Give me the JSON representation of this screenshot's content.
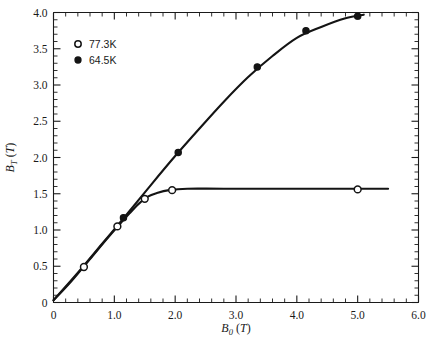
{
  "chart_data": {
    "type": "scatter",
    "title": "",
    "xlabel": "B_0 (T)",
    "xlabel_base": "B",
    "xlabel_sub": "0",
    "xlabel_unit": "(T)",
    "ylabel": "B_T (T)",
    "ylabel_base": "B",
    "ylabel_sub": "T",
    "ylabel_unit": "(T)",
    "xlim": [
      0,
      6.0
    ],
    "ylim": [
      0,
      4.0
    ],
    "xticks": [
      0,
      1.0,
      2.0,
      3.0,
      4.0,
      5.0,
      6.0
    ],
    "xticklabels": [
      "0",
      "1.0",
      "2.0",
      "3.0",
      "4.0",
      "5.0",
      "6.0"
    ],
    "yticks": [
      0,
      0.5,
      1.0,
      1.5,
      2.0,
      2.5,
      3.0,
      3.5,
      4.0
    ],
    "yticklabels": [
      "0",
      "0.5",
      "1.0",
      "1.5",
      "2.0",
      "2.5",
      "3.0",
      "3.5",
      "4.0"
    ],
    "x_minor_interval": 0.2,
    "y_minor_interval": 0.1,
    "grid": false,
    "legend_position": "upper-left",
    "series": [
      {
        "name": "77.3K",
        "marker": "open-circle",
        "color": "#141414",
        "points": [
          {
            "x": 0.5,
            "y": 0.49
          },
          {
            "x": 1.05,
            "y": 1.05
          },
          {
            "x": 1.5,
            "y": 1.43
          },
          {
            "x": 1.95,
            "y": 1.55
          },
          {
            "x": 5.0,
            "y": 1.56
          }
        ],
        "fit_curve": [
          {
            "x": 0.0,
            "y": 0.03
          },
          {
            "x": 0.3,
            "y": 0.3
          },
          {
            "x": 0.6,
            "y": 0.6
          },
          {
            "x": 0.9,
            "y": 0.9
          },
          {
            "x": 1.1,
            "y": 1.09
          },
          {
            "x": 1.25,
            "y": 1.23
          },
          {
            "x": 1.4,
            "y": 1.36
          },
          {
            "x": 1.55,
            "y": 1.46
          },
          {
            "x": 1.7,
            "y": 1.51
          },
          {
            "x": 1.9,
            "y": 1.55
          },
          {
            "x": 2.2,
            "y": 1.57
          },
          {
            "x": 2.8,
            "y": 1.57
          },
          {
            "x": 4.0,
            "y": 1.57
          },
          {
            "x": 5.5,
            "y": 1.57
          }
        ]
      },
      {
        "name": "64.5K",
        "marker": "filled-circle",
        "color": "#141414",
        "points": [
          {
            "x": 1.15,
            "y": 1.17
          },
          {
            "x": 2.05,
            "y": 2.07
          },
          {
            "x": 3.35,
            "y": 3.25
          },
          {
            "x": 4.15,
            "y": 3.75
          },
          {
            "x": 5.0,
            "y": 3.95
          }
        ],
        "fit_curve": [
          {
            "x": 0.0,
            "y": 0.03
          },
          {
            "x": 0.4,
            "y": 0.41
          },
          {
            "x": 0.8,
            "y": 0.81
          },
          {
            "x": 1.2,
            "y": 1.21
          },
          {
            "x": 1.6,
            "y": 1.62
          },
          {
            "x": 2.0,
            "y": 2.02
          },
          {
            "x": 2.4,
            "y": 2.4
          },
          {
            "x": 2.8,
            "y": 2.77
          },
          {
            "x": 3.2,
            "y": 3.11
          },
          {
            "x": 3.6,
            "y": 3.4
          },
          {
            "x": 4.0,
            "y": 3.65
          },
          {
            "x": 4.4,
            "y": 3.8
          },
          {
            "x": 4.8,
            "y": 3.92
          },
          {
            "x": 5.1,
            "y": 3.97
          }
        ]
      }
    ]
  },
  "legend": {
    "entries": [
      {
        "label": "77.3K",
        "marker": "open-circle"
      },
      {
        "label": "64.5K",
        "marker": "filled-circle"
      }
    ]
  },
  "colors": {
    "ink": "#141414",
    "background": "#ffffff"
  }
}
